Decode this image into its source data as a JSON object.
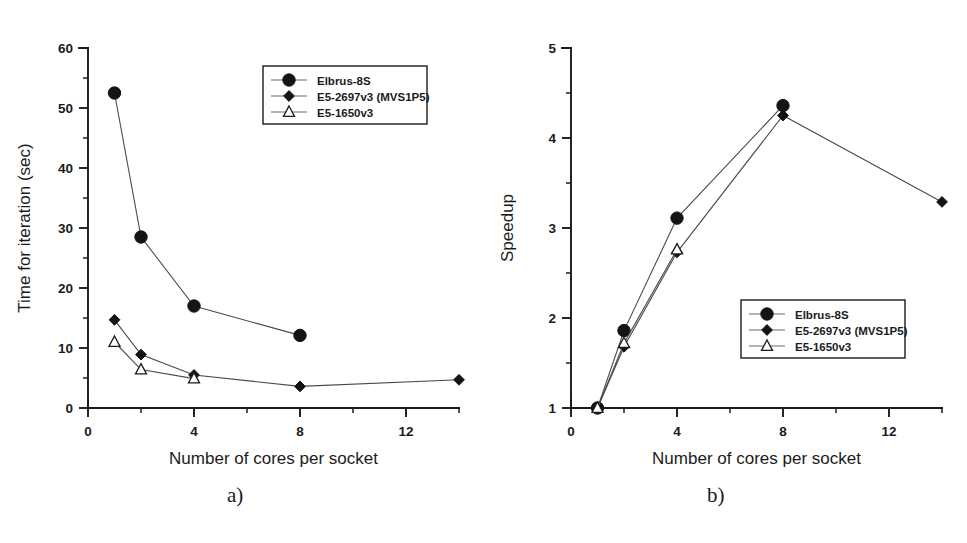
{
  "figure": {
    "panel_a_caption": "a)",
    "panel_b_caption": "b)"
  },
  "series_meta": [
    {
      "key": "elbrus",
      "label": "Elbrus-8S",
      "marker": "circle"
    },
    {
      "key": "e5_2697",
      "label": "E5-2697v3 (MVS1P5)",
      "marker": "diamond"
    },
    {
      "key": "e5_1650",
      "label": "E5-1650v3",
      "marker": "triangle"
    }
  ],
  "chart_data": [
    {
      "panel": "a",
      "type": "line",
      "title": "",
      "xlabel": "Number of cores per socket",
      "ylabel": "Time for iteration (sec)",
      "xlim": [
        0,
        14
      ],
      "ylim": [
        0,
        60
      ],
      "xticks": [
        0,
        4,
        8,
        12
      ],
      "xticks_minor": [
        2,
        6,
        10,
        14
      ],
      "yticks": [
        0,
        10,
        20,
        30,
        40,
        50,
        60
      ],
      "yticks_minor": [
        5,
        15,
        25,
        35,
        45,
        55
      ],
      "grid": false,
      "legend_position": "upper-center",
      "series": [
        {
          "name": "Elbrus-8S",
          "marker": "circle",
          "x": [
            1,
            2,
            4,
            8
          ],
          "values": [
            52.5,
            28.5,
            17.0,
            12.1
          ]
        },
        {
          "name": "E5-2697v3 (MVS1P5)",
          "marker": "diamond",
          "x": [
            1,
            2,
            4,
            8,
            14
          ],
          "values": [
            14.7,
            8.9,
            5.5,
            3.6,
            4.7
          ]
        },
        {
          "name": "E5-1650v3",
          "marker": "triangle",
          "x": [
            1,
            2,
            4
          ],
          "values": [
            11.0,
            6.4,
            4.9
          ]
        }
      ]
    },
    {
      "panel": "b",
      "type": "line",
      "title": "",
      "xlabel": "Number of cores per socket",
      "ylabel": "Speedup",
      "xlim": [
        0,
        14
      ],
      "ylim": [
        1,
        5
      ],
      "xticks": [
        0,
        4,
        8,
        12
      ],
      "xticks_minor": [
        2,
        6,
        10,
        14
      ],
      "yticks": [
        1,
        2,
        3,
        4,
        5
      ],
      "yticks_minor": [
        1.5,
        2.5,
        3.5,
        4.5
      ],
      "grid": false,
      "legend_position": "lower-right",
      "series": [
        {
          "name": "Elbrus-8S",
          "marker": "circle",
          "x": [
            1,
            2,
            4,
            8
          ],
          "values": [
            1.0,
            1.86,
            3.11,
            4.36
          ]
        },
        {
          "name": "E5-2697v3 (MVS1P5)",
          "marker": "diamond",
          "x": [
            1,
            2,
            4,
            8,
            14
          ],
          "values": [
            1.0,
            1.68,
            2.73,
            4.25,
            3.29
          ]
        },
        {
          "name": "E5-1650v3",
          "marker": "triangle",
          "x": [
            1,
            2,
            4
          ],
          "values": [
            1.0,
            1.72,
            2.76
          ]
        }
      ]
    }
  ]
}
